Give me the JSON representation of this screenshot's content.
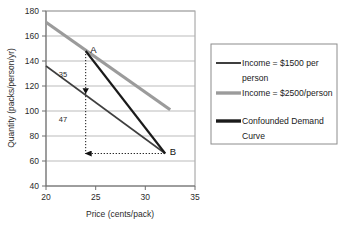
{
  "chart_data": {
    "type": "line",
    "title": "",
    "xlabel": "Price (cents/pack)",
    "ylabel": "Quantity (packs/person/yr)",
    "xlim": [
      20,
      35
    ],
    "ylim": [
      40,
      180
    ],
    "xticks": [
      "20",
      "25",
      "30",
      "35"
    ],
    "yticks": [
      "180",
      "160",
      "140",
      "120",
      "100",
      "80",
      "60",
      "40"
    ],
    "grid": "horizontal",
    "legend_position": "right",
    "series": [
      {
        "name": "Income = $1500 per person",
        "color": "#3f3f3f",
        "width": 1.6,
        "points": [
          [
            20,
            136
          ],
          [
            32,
            66
          ]
        ]
      },
      {
        "name": "Income = $2500/person",
        "color": "#9b9b9b",
        "width": 3.2,
        "points": [
          [
            20,
            171
          ],
          [
            32.5,
            101
          ]
        ]
      },
      {
        "name": "Confounded Demand Curve",
        "color": "#1a1a1a",
        "width": 2.1,
        "points": [
          [
            24,
            148
          ],
          [
            32,
            66
          ]
        ]
      }
    ],
    "annotations": [
      {
        "name": "point-a",
        "text": "A",
        "x": 24,
        "y": 148
      },
      {
        "name": "point-b",
        "text": "B",
        "x": 32,
        "y": 66
      },
      {
        "name": "segment-35",
        "text": "35",
        "x": 21.7,
        "y": 130
      },
      {
        "name": "segment-47",
        "text": "47",
        "x": 21.7,
        "y": 94
      }
    ],
    "guides": [
      {
        "name": "vertical-drop-arrow",
        "style": "dotted-arrow",
        "from": [
          24,
          148
        ],
        "to": [
          24,
          66
        ]
      },
      {
        "name": "mid-arrow-marker",
        "style": "arrowhead",
        "at": [
          24,
          115
        ]
      },
      {
        "name": "horizontal-connector",
        "style": "dotted",
        "from": [
          24,
          66
        ],
        "to": [
          32,
          66
        ]
      }
    ]
  },
  "legend": {
    "items": [
      {
        "label": "Income = $1500 per person",
        "color": "#3f3f3f",
        "thickness": "2"
      },
      {
        "label": "Income = $2500/person",
        "color": "#9b9b9b",
        "thickness": "3.4"
      },
      {
        "label": "Confounded Demand Curve",
        "color": "#1a1a1a",
        "thickness": "3.4"
      }
    ]
  },
  "colors": {
    "plot_border": "#9a9a9a",
    "gridline": "#b3b3b3",
    "axis": "#6e6e6e",
    "legend_border": "#8c8c8c",
    "background": "#ffffff"
  }
}
